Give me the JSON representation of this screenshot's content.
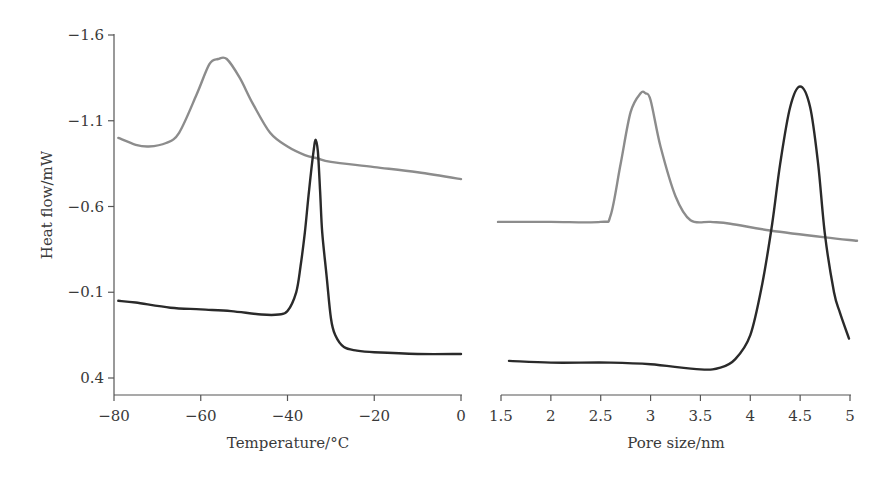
{
  "chart_data": [
    {
      "type": "line",
      "panel": "left",
      "title": "",
      "xlabel": "Temperature/°C",
      "ylabel": "Heat flow/mW",
      "xlim": [
        -80,
        0
      ],
      "ylim": [
        -1.6,
        0.4
      ],
      "y_inverted": true,
      "xticks": [
        "-80",
        "-60",
        "-40",
        "-20",
        "0"
      ],
      "yticks": [
        "-1.6",
        "-1.1",
        "-0.6",
        "-0.1",
        "0.4"
      ],
      "grid": false,
      "legend": null,
      "series": [
        {
          "name": "gray curve",
          "color": "#8c8c8c",
          "x": [
            -79,
            -75,
            -72,
            -68,
            -65,
            -61,
            -58,
            -56,
            -54,
            -51,
            -48,
            -44,
            -40,
            -36,
            -33,
            -30,
            -20,
            -10,
            0
          ],
          "y": [
            -1.0,
            -0.96,
            -0.95,
            -0.97,
            -1.03,
            -1.25,
            -1.43,
            -1.46,
            -1.46,
            -1.35,
            -1.2,
            -1.03,
            -0.95,
            -0.9,
            -0.88,
            -0.86,
            -0.83,
            -0.8,
            -0.76
          ]
        },
        {
          "name": "black curve",
          "color": "#2a2a2a",
          "x": [
            -79,
            -75,
            -67,
            -60,
            -53,
            -46,
            -42,
            -40,
            -38,
            -37,
            -36,
            -35,
            -34,
            -33.5,
            -33,
            -32.5,
            -32,
            -31,
            -30,
            -29,
            -27,
            -24,
            -20,
            -10,
            0
          ],
          "y": [
            -0.05,
            -0.04,
            -0.01,
            0.0,
            0.01,
            0.03,
            0.03,
            0.01,
            -0.1,
            -0.25,
            -0.45,
            -0.7,
            -0.92,
            -0.99,
            -0.92,
            -0.7,
            -0.45,
            -0.2,
            0.05,
            0.15,
            0.22,
            0.24,
            0.25,
            0.26,
            0.26
          ]
        }
      ]
    },
    {
      "type": "line",
      "panel": "right",
      "title": "",
      "xlabel": "Pore size/nm",
      "ylabel": "Heat flow/mW",
      "xlim": [
        1.5,
        5.0
      ],
      "ylim": [
        -1.6,
        0.4
      ],
      "y_inverted": true,
      "xticks": [
        "1.5",
        "2",
        "2.5",
        "3",
        "3.5",
        "4",
        "4.5",
        "5"
      ],
      "grid": false,
      "legend": null,
      "series": [
        {
          "name": "gray curve",
          "color": "#8c8c8c",
          "x": [
            1.47,
            2.0,
            2.5,
            2.6,
            2.7,
            2.8,
            2.9,
            2.95,
            3.0,
            3.1,
            3.25,
            3.4,
            3.6,
            3.8,
            4.2,
            4.75,
            5.07
          ],
          "y": [
            -0.51,
            -0.51,
            -0.51,
            -0.55,
            -0.85,
            -1.15,
            -1.26,
            -1.26,
            -1.22,
            -0.95,
            -0.66,
            -0.52,
            -0.51,
            -0.5,
            -0.46,
            -0.42,
            -0.4
          ]
        },
        {
          "name": "black curve",
          "color": "#2a2a2a",
          "x": [
            1.58,
            2.0,
            2.6,
            3.0,
            3.5,
            3.7,
            3.85,
            4.0,
            4.12,
            4.22,
            4.3,
            4.4,
            4.5,
            4.6,
            4.68,
            4.75,
            4.84,
            4.9,
            4.99
          ],
          "y": [
            0.3,
            0.31,
            0.31,
            0.32,
            0.35,
            0.34,
            0.29,
            0.15,
            -0.15,
            -0.5,
            -0.85,
            -1.18,
            -1.3,
            -1.18,
            -0.85,
            -0.43,
            -0.1,
            0.02,
            0.17
          ]
        }
      ]
    }
  ],
  "labels": {
    "ylabel": "Heat flow/mW",
    "left_xlabel": "Temperature/°C",
    "right_xlabel": "Pore size/nm",
    "left_yticks": [
      "−1.6",
      "−1.1",
      "−0.6",
      "−0.1",
      "0.4"
    ],
    "left_xticks": [
      "−80",
      "−60",
      "−40",
      "−20",
      "0"
    ],
    "right_xticks": [
      "1.5",
      "2",
      "2.5",
      "3",
      "3.5",
      "4",
      "4.5",
      "5"
    ]
  }
}
